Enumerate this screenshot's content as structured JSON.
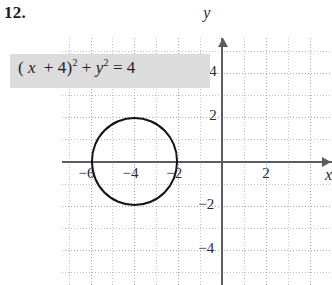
{
  "problem": {
    "number": "12."
  },
  "equation": {
    "full_text": "(x + 4)^2 + y^2 = 4",
    "lhs_open": "(",
    "var_x": "x",
    "plus_1": "+",
    "const_4": "4",
    "close_paren": ")",
    "exp_2a": "2",
    "plus_2": "+",
    "var_y": "y",
    "exp_2b": "2",
    "equals": "=",
    "rhs": "4",
    "highlight_color": "#dcdcdc"
  },
  "chart_data": {
    "type": "scatter",
    "title": "",
    "subtitle": "",
    "xlabel": "x",
    "ylabel": "y",
    "xlim": [
      -7.3,
      5.0
    ],
    "ylim": [
      -5.6,
      5.6
    ],
    "grid": true,
    "grid_minor_spacing": 1,
    "grid_major_spacing": 2,
    "legend": null,
    "x_ticks": [
      -6,
      -4,
      -2,
      2
    ],
    "x_tick_labels": [
      "−6",
      "−4",
      "−2",
      "2"
    ],
    "y_ticks": [
      4,
      2,
      -2,
      -4
    ],
    "y_tick_labels": [
      "4",
      "2",
      "−2",
      "−4"
    ],
    "axis_arrows": [
      "x-positive",
      "y-positive"
    ],
    "shapes": [
      {
        "kind": "circle",
        "equation": "(x + 4)^2 + y^2 = 4",
        "center": [
          -4,
          0
        ],
        "radius": 2,
        "stroke": "#141418",
        "stroke_width": 2.6,
        "fill": "none",
        "x_intercepts": [
          -6,
          -2
        ],
        "y_extrema": [
          2,
          -2
        ]
      }
    ],
    "annotations": []
  },
  "axes_labels": {
    "x": "x",
    "y": "y"
  },
  "colors": {
    "axis": "#5c5c66",
    "grid": "#a8a8b4",
    "curve": "#141418",
    "text": "#1c1c1c",
    "highlight": "#dcdcdc",
    "background": "#ffffff"
  }
}
